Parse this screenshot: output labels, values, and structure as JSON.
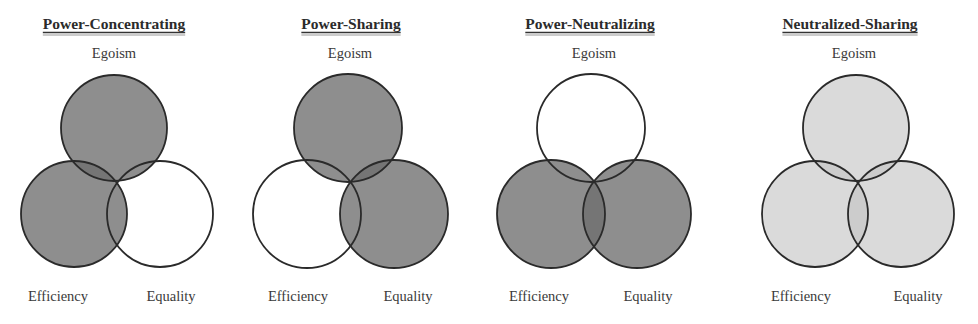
{
  "colors": {
    "dark_fill": "#8b8b8b",
    "light_fill": "#d9d9d9",
    "empty_fill": "#ffffff",
    "stroke": "#2a2a2a",
    "text": "#2b2b2b"
  },
  "panels": [
    {
      "title": "Power-Concentrating",
      "title_x": 114,
      "labels": {
        "top": "Egoism",
        "bottom_left": "Efficiency",
        "bottom_right": "Equality"
      },
      "label_pos": {
        "top_x": 114,
        "bl_x": 58,
        "br_x": 171
      },
      "circles": {
        "egoism": {
          "cx": 114,
          "cy": 128,
          "r": 53,
          "fill": "dark"
        },
        "efficiency": {
          "cx": 74,
          "cy": 214,
          "r": 53,
          "fill": "dark"
        },
        "equality": {
          "cx": 160,
          "cy": 214,
          "r": 53,
          "fill": "empty"
        }
      }
    },
    {
      "title": "Power-Sharing",
      "title_x": 351,
      "labels": {
        "top": "Egoism",
        "bottom_left": "Efficiency",
        "bottom_right": "Equality"
      },
      "label_pos": {
        "top_x": 350,
        "bl_x": 298,
        "br_x": 408
      },
      "circles": {
        "egoism": {
          "cx": 348,
          "cy": 128,
          "r": 54,
          "fill": "dark"
        },
        "efficiency": {
          "cx": 307,
          "cy": 214,
          "r": 54,
          "fill": "empty"
        },
        "equality": {
          "cx": 394,
          "cy": 214,
          "r": 54,
          "fill": "dark"
        }
      }
    },
    {
      "title": "Power-Neutralizing",
      "title_x": 590,
      "labels": {
        "top": "Egoism",
        "bottom_left": "Efficiency",
        "bottom_right": "Equality"
      },
      "label_pos": {
        "top_x": 594,
        "bl_x": 539,
        "br_x": 648
      },
      "circles": {
        "egoism": {
          "cx": 591,
          "cy": 128,
          "r": 54,
          "fill": "empty"
        },
        "efficiency": {
          "cx": 551,
          "cy": 214,
          "r": 54,
          "fill": "dark"
        },
        "equality": {
          "cx": 637,
          "cy": 214,
          "r": 54,
          "fill": "dark"
        }
      }
    },
    {
      "title": "Neutralized-Sharing",
      "title_x": 850,
      "labels": {
        "top": "Egoism",
        "bottom_left": "Efficiency",
        "bottom_right": "Equality"
      },
      "label_pos": {
        "top_x": 854,
        "bl_x": 801,
        "br_x": 918
      },
      "circles": {
        "egoism": {
          "cx": 856,
          "cy": 128,
          "r": 53,
          "fill": "light"
        },
        "efficiency": {
          "cx": 815,
          "cy": 214,
          "r": 53,
          "fill": "light"
        },
        "equality": {
          "cx": 901,
          "cy": 214,
          "r": 53,
          "fill": "light"
        }
      }
    }
  ]
}
